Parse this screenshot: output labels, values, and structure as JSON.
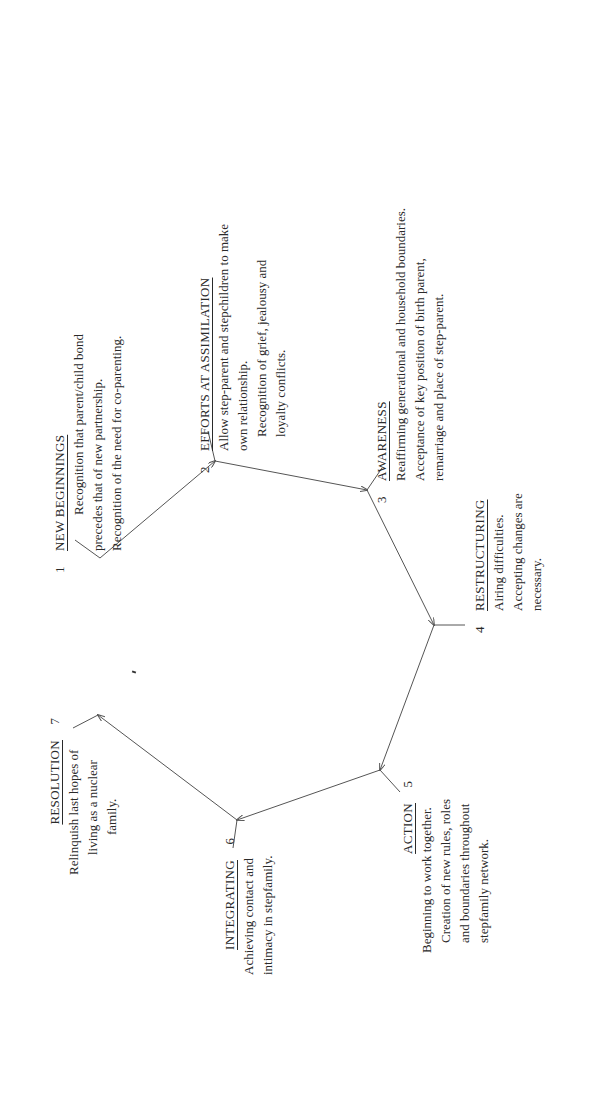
{
  "diagram": {
    "type": "cycle",
    "orientation": "rotated-90-ccw",
    "stages": [
      {
        "number": "1",
        "title": "NEW BEGINNINGS",
        "lines": [
          "Recognition that parent/child bond",
          "precedes that of new partnership.",
          "Recognition of the need for co-parenting."
        ]
      },
      {
        "number": "2",
        "title": "EFFORTS AT ASSIMILATION",
        "lines": [
          "Allow step-parent and stepchildren to make",
          "own relationship.",
          "Recognition of grief, jealousy and",
          "loyalty conflicts."
        ]
      },
      {
        "number": "3",
        "title": "AWARENESS",
        "lines": [
          "Reaffirming generational and household boundaries.",
          "Acceptance of key position of birth parent,",
          "remarriage and place of step-parent."
        ]
      },
      {
        "number": "4",
        "title": "RESTRUCTURING",
        "lines": [
          "Airing difficulties.",
          "Accepting changes are",
          "necessary."
        ]
      },
      {
        "number": "5",
        "title": "ACTION",
        "lines": [
          "Beginning to work together.",
          "Creation of new rules, roles",
          "and boundaries throughout",
          "stepfamily network."
        ]
      },
      {
        "number": "6",
        "title": "INTEGRATING",
        "lines": [
          "Achieving contact and",
          "intimacy in stepfamily."
        ]
      },
      {
        "number": "7",
        "title": "RESOLUTION",
        "lines": [
          "Relinquish last hopes of",
          "living as a nuclear",
          "family."
        ]
      }
    ],
    "connections": [
      {
        "from": "1",
        "to": "2"
      },
      {
        "from": "2",
        "to": "3"
      },
      {
        "from": "3",
        "to": "4"
      },
      {
        "from": "4",
        "to": "5"
      },
      {
        "from": "5",
        "to": "6"
      },
      {
        "from": "6",
        "to": "7"
      }
    ],
    "colors": {
      "line": "#555555",
      "text": "#2a2a2a",
      "background": "#ffffff"
    }
  }
}
